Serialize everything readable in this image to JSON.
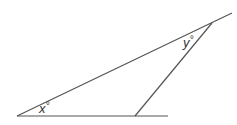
{
  "diagram": {
    "type": "geometry-triangle",
    "line_color": "#555555",
    "labels": {
      "x": {
        "text": "x",
        "degree": "°"
      },
      "y": {
        "text": "y",
        "degree": "°"
      }
    },
    "points": {
      "left_vertex": [
        17,
        116
      ],
      "top_vertex": [
        212,
        23
      ],
      "bottom_vertex": [
        135,
        116
      ],
      "base_line_end": [
        168,
        116
      ],
      "top_line_end": [
        232,
        13
      ]
    }
  }
}
